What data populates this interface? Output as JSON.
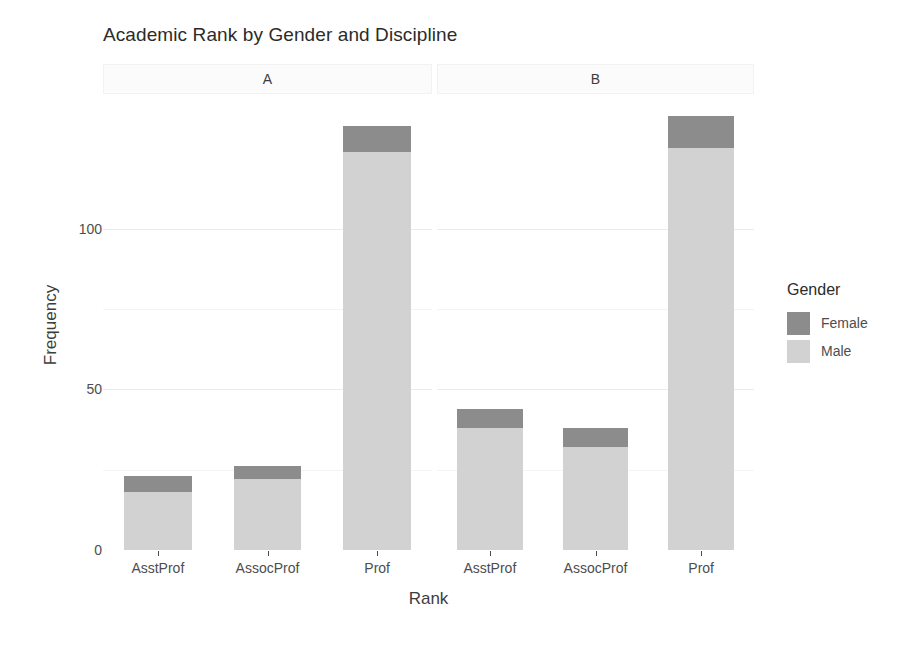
{
  "chart_data": {
    "type": "bar",
    "title": "Academic Rank by Gender and Discipline",
    "xlabel": "Rank",
    "ylabel": "Frequency",
    "stacked": true,
    "orientation": "vertical",
    "grid": true,
    "ylim": [
      0,
      141
    ],
    "yticks": [
      0,
      50,
      100
    ],
    "ytick_labels": [
      "0",
      "50",
      "100"
    ],
    "categories": [
      "AsstProf",
      "AssocProf",
      "Prof"
    ],
    "facet_variable": "Discipline",
    "facets": [
      {
        "label": "A",
        "series": [
          {
            "name": "Male",
            "values": [
              18,
              22,
              124
            ]
          },
          {
            "name": "Female",
            "values": [
              5,
              4,
              8
            ]
          }
        ],
        "totals": [
          23,
          26,
          132
        ]
      },
      {
        "label": "B",
        "series": [
          {
            "name": "Male",
            "values": [
              38,
              32,
              125
            ]
          },
          {
            "name": "Female",
            "values": [
              6,
              6,
              10
            ]
          }
        ],
        "totals": [
          44,
          38,
          135
        ]
      }
    ],
    "legend": {
      "title": "Gender",
      "position": "right",
      "entries": [
        {
          "label": "Female",
          "color": "#8c8c8c"
        },
        {
          "label": "Male",
          "color": "#d2d2d2"
        }
      ]
    },
    "colors": {
      "female": "#8c8c8c",
      "male": "#d2d2d2",
      "panel_background": "#ffffff",
      "gridline_major": "#ebebeb",
      "gridline_minor": "#f5f5f5",
      "strip_background": "#fbfbfb",
      "text": "#4d4d4d"
    }
  }
}
